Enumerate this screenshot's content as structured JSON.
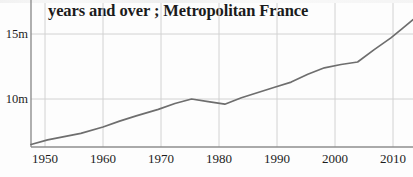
{
  "figure": {
    "title": "years and over ; Metropolitan France",
    "background_color": "#fdfdfd",
    "line_color": "#6e6e6e",
    "grid_color": "#d0d0d0",
    "axis_color": "#9a9a9a",
    "text_color": "#1c1c1c"
  },
  "chart_data": {
    "type": "line",
    "title": "years and over ; Metropolitan France",
    "xlabel": "",
    "ylabel": "",
    "xlim": [
      1947,
      2016
    ],
    "ylim": [
      5.9,
      16.4
    ],
    "grid": true,
    "legend": null,
    "xticks": [
      1950,
      1960,
      1970,
      1980,
      1990,
      2000,
      2010
    ],
    "xtick_labels": [
      "1950",
      "1960",
      "1970",
      "1980",
      "1990",
      "2000",
      "2010"
    ],
    "yticks": [
      10,
      15
    ],
    "ytick_labels": [
      "10m",
      "15m"
    ],
    "y_unit": "millions",
    "series": [
      {
        "name": "Population",
        "x": [
          1947,
          1950,
          1953,
          1956,
          1960,
          1963,
          1966,
          1970,
          1973,
          1976,
          1979,
          1982,
          1985,
          1988,
          1991,
          1994,
          1997,
          2000,
          2003,
          2006,
          2009,
          2012,
          2014,
          2016
        ],
        "values": [
          6.5,
          6.85,
          7.1,
          7.35,
          7.85,
          8.3,
          8.7,
          9.2,
          9.65,
          10.0,
          9.8,
          9.6,
          10.1,
          10.5,
          10.9,
          11.3,
          11.9,
          12.4,
          12.65,
          12.85,
          13.8,
          14.7,
          15.4,
          16.1
        ]
      }
    ]
  },
  "annotations": {
    "local_peak_year": 1976,
    "local_peak_value": 10.0,
    "trough_year": 1982,
    "trough_value": 9.6,
    "plateau_range": "2003-2006"
  }
}
